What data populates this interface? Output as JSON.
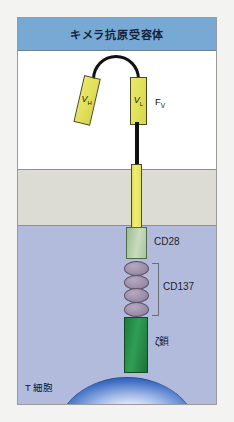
{
  "header": {
    "title": "キメラ抗原受容体"
  },
  "regions": {
    "extracellular": "extracellular-space",
    "membrane": "cell-membrane",
    "cytoplasm": "cytoplasm"
  },
  "scfv": {
    "vh_label": "V",
    "vh_sub": "H",
    "vl_label": "V",
    "vl_sub": "L",
    "fv_label": "F",
    "fv_sub": "V"
  },
  "domains": {
    "cd28_label": "CD28",
    "cd137_label": "CD137",
    "cd137_count": 4,
    "zeta_label": "ζ鎖"
  },
  "cell": {
    "tcell_label": "T 細胞"
  },
  "colors": {
    "header_bar": "#77a9d4",
    "extracellular": "#ffffff",
    "membrane": "#dcdcd4",
    "cytoplasm": "#b3bbdd",
    "scfv_yellow": "#e2e25c",
    "hinge_yellow": "#dede52",
    "cd28_green": "#c8dcbe",
    "cd137_purple": "#9c8daa",
    "zeta_green": "#2f9f55",
    "tcell_blue": "#1f4ea8",
    "linker_black": "#111111",
    "frame_border": "#9a9a9a"
  }
}
